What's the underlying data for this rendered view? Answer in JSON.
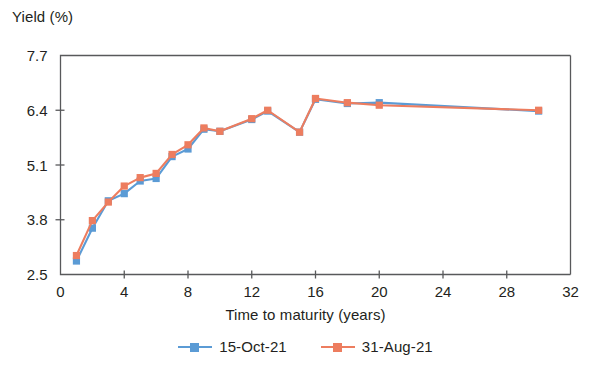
{
  "chart_data": {
    "type": "line",
    "title": "",
    "xlabel": "Time to maturity (years)",
    "ylabel": "Yield (%)",
    "xlim": [
      0,
      32
    ],
    "ylim": [
      2.5,
      7.7
    ],
    "xticks": [
      0,
      4,
      8,
      12,
      16,
      20,
      24,
      28,
      32
    ],
    "yticks": [
      2.5,
      3.8,
      5.1,
      6.4,
      7.7
    ],
    "xtick_labels": [
      "0",
      "4",
      "8",
      "12",
      "16",
      "20",
      "24",
      "28",
      "32"
    ],
    "ytick_labels": [
      "2.5",
      "3.8",
      "5.1",
      "6.4",
      "7.7"
    ],
    "grid": false,
    "legend_position": "bottom-center",
    "colors": {
      "series_1": "#5b9bd5",
      "series_2": "#ed7d5f",
      "axis": "#58595b",
      "text": "#231f20",
      "background": "#ffffff"
    },
    "x": [
      1,
      2,
      3,
      4,
      5,
      6,
      7,
      8,
      9,
      10,
      12,
      13,
      15,
      16,
      18,
      20,
      30
    ],
    "series": [
      {
        "name": "15-Oct-21",
        "color": "#5b9bd5",
        "values": [
          2.82,
          3.6,
          4.25,
          4.42,
          4.72,
          4.78,
          5.3,
          5.48,
          5.95,
          5.9,
          6.18,
          6.38,
          5.88,
          6.66,
          6.56,
          6.58,
          6.38
        ]
      },
      {
        "name": "31-Aug-21",
        "color": "#ed7d5f",
        "values": [
          2.95,
          3.78,
          4.22,
          4.6,
          4.8,
          4.9,
          5.35,
          5.58,
          5.98,
          5.9,
          6.2,
          6.4,
          5.88,
          6.68,
          6.58,
          6.52,
          6.4
        ]
      }
    ]
  },
  "legend": {
    "items": [
      {
        "label": "15-Oct-21",
        "color": "#5b9bd5"
      },
      {
        "label": "31-Aug-21",
        "color": "#ed7d5f"
      }
    ]
  }
}
